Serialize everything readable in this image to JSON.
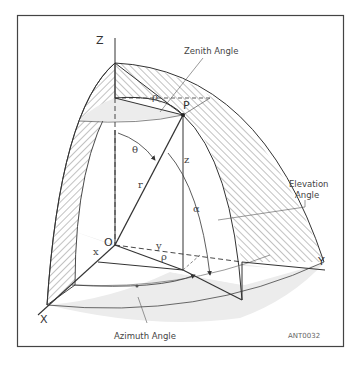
{
  "diagram": {
    "axes": {
      "z": "Z",
      "y": "Y",
      "x": "X"
    },
    "points": {
      "origin": "O",
      "point": "P"
    },
    "symbols": {
      "theta": "θ",
      "r": "r",
      "z": "z",
      "rho_top": "ρ",
      "rho_base": "ρ",
      "alpha": "α",
      "x": "x",
      "y": "y"
    },
    "callouts": {
      "zenith": "Zenith Angle",
      "elevation_line1": "Elevation",
      "elevation_line2": "Angle",
      "azimuth": "Azimuth Angle"
    },
    "figure_code": "ANT0032",
    "colors": {
      "line": "#333333",
      "hatch": "#555555",
      "shade": "#e9e9e9",
      "frame": "#444444"
    }
  }
}
